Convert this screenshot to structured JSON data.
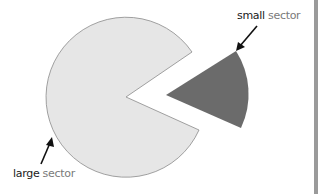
{
  "diagram": {
    "colors": {
      "background": "#ffffff",
      "large_sector_fill": "#e6e6e6",
      "large_sector_stroke": "#8a8a8a",
      "small_sector_fill": "#6b6b6b",
      "arrow": "#111111",
      "edge": "#9a9a9a"
    },
    "labels": {
      "small": {
        "bold": "small",
        "rest": " sector"
      },
      "large": {
        "bold": "large",
        "rest": " sector"
      }
    }
  }
}
